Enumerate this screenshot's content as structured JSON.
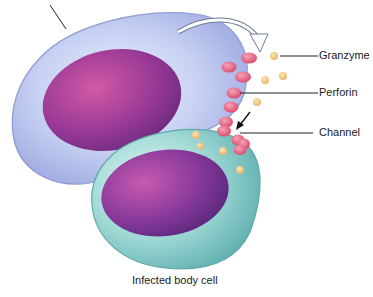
{
  "diagram": {
    "labels": {
      "granzyme": "Granzyme",
      "perforin": "Perforin",
      "channel": "Channel"
    },
    "caption": "Infected body cell",
    "colors": {
      "killer_cell_cytoplasm": "#b9c6ee",
      "killer_cell_border": "#8f9ad6",
      "killer_nucleus": "#8a2f8a",
      "infected_cell_cytoplasm": "#8fd0cc",
      "infected_cell_border": "#5fa8a8",
      "infected_nucleus": "#7b2b8e",
      "perforin": "#e8607e",
      "granzyme": "#f2c27a",
      "line": "#222222"
    }
  }
}
